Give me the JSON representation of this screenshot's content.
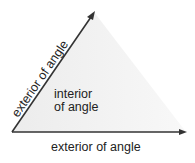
{
  "diagram": {
    "labels": {
      "exterior_ray_upper": "exterior of angle",
      "interior_line1": "interior",
      "interior_line2": "of angle",
      "exterior_ray_lower": "exterior of angle"
    },
    "colors": {
      "line": "#333333",
      "interior_fill": "#f0f0f0",
      "text": "#222222"
    },
    "geometry": {
      "vertex": [
        12,
        132
      ],
      "upper_ray_tip": [
        94,
        12
      ],
      "lower_ray_tip": [
        186,
        133
      ]
    }
  }
}
